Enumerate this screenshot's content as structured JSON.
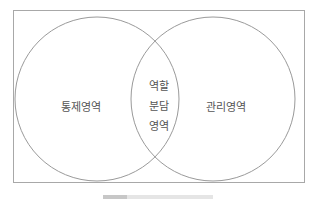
{
  "diagram": {
    "type": "venn",
    "sets": [
      {
        "id": "left",
        "label": "통제영역"
      },
      {
        "id": "right",
        "label": "관리영역"
      }
    ],
    "intersection": {
      "lines": [
        "역할",
        "분담",
        "영역"
      ]
    },
    "colors": {
      "stroke": "#9a9a9a",
      "frame": "#a8a8a8",
      "text": "#555555"
    }
  },
  "caption": {
    "text": ""
  }
}
